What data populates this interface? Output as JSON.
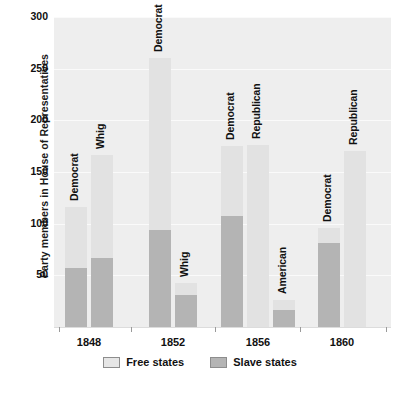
{
  "chart_data": {
    "type": "bar",
    "subtype": "stacked-grouped-bar",
    "title": "",
    "xlabel": "",
    "ylabel": "Party members in House of Representatives",
    "ylim": [
      0,
      300
    ],
    "yticks": [
      50,
      100,
      150,
      200,
      250,
      300
    ],
    "grid": true,
    "legend_position": "bottom",
    "categories": [
      "1848",
      "1852",
      "1856",
      "1860"
    ],
    "series": [
      {
        "name": "Free states",
        "color": "#e2e2e2"
      },
      {
        "name": "Slave states",
        "color": "#b4b4b4"
      }
    ],
    "groups": [
      {
        "category": "1848",
        "bars": [
          {
            "party": "Democrat",
            "total": 116,
            "slave_states": 57,
            "free_states": 59
          },
          {
            "party": "Whig",
            "total": 166,
            "slave_states": 67,
            "free_states": 99
          }
        ]
      },
      {
        "category": "1852",
        "bars": [
          {
            "party": "Democrat",
            "total": 260,
            "slave_states": 94,
            "free_states": 166
          },
          {
            "party": "Whig",
            "total": 43,
            "slave_states": 31,
            "free_states": 12
          }
        ]
      },
      {
        "category": "1856",
        "bars": [
          {
            "party": "Democrat",
            "total": 175,
            "slave_states": 107,
            "free_states": 68
          },
          {
            "party": "Republican",
            "total": 176,
            "slave_states": 0,
            "free_states": 176
          },
          {
            "party": "American",
            "total": 26,
            "slave_states": 16,
            "free_states": 10
          }
        ]
      },
      {
        "category": "1860",
        "bars": [
          {
            "party": "Democrat",
            "total": 96,
            "slave_states": 81,
            "free_states": 15
          },
          {
            "party": "Republican",
            "total": 170,
            "slave_states": 0,
            "free_states": 170
          }
        ]
      }
    ]
  },
  "axis": {
    "y_title": "Party members in House of Representatives",
    "y_ticks": [
      "300",
      "250",
      "200",
      "150",
      "100",
      "50"
    ],
    "x_ticks": [
      "1848",
      "1852",
      "1856",
      "1860"
    ]
  },
  "legend": {
    "items": [
      {
        "label": "Free states",
        "swatch": "free"
      },
      {
        "label": "Slave states",
        "swatch": "slave"
      }
    ]
  },
  "bar_labels": [
    "Democrat",
    "Whig",
    "Democrat",
    "Whig",
    "Democrat",
    "Republican",
    "American",
    "Democrat",
    "Republican"
  ],
  "colors": {
    "free_states": "#e2e2e2",
    "slave_states": "#b4b4b4",
    "plot_background": "#eeeeee",
    "grid_line": "#fafafa",
    "page_background": "#ffffff",
    "text": "#111111"
  }
}
